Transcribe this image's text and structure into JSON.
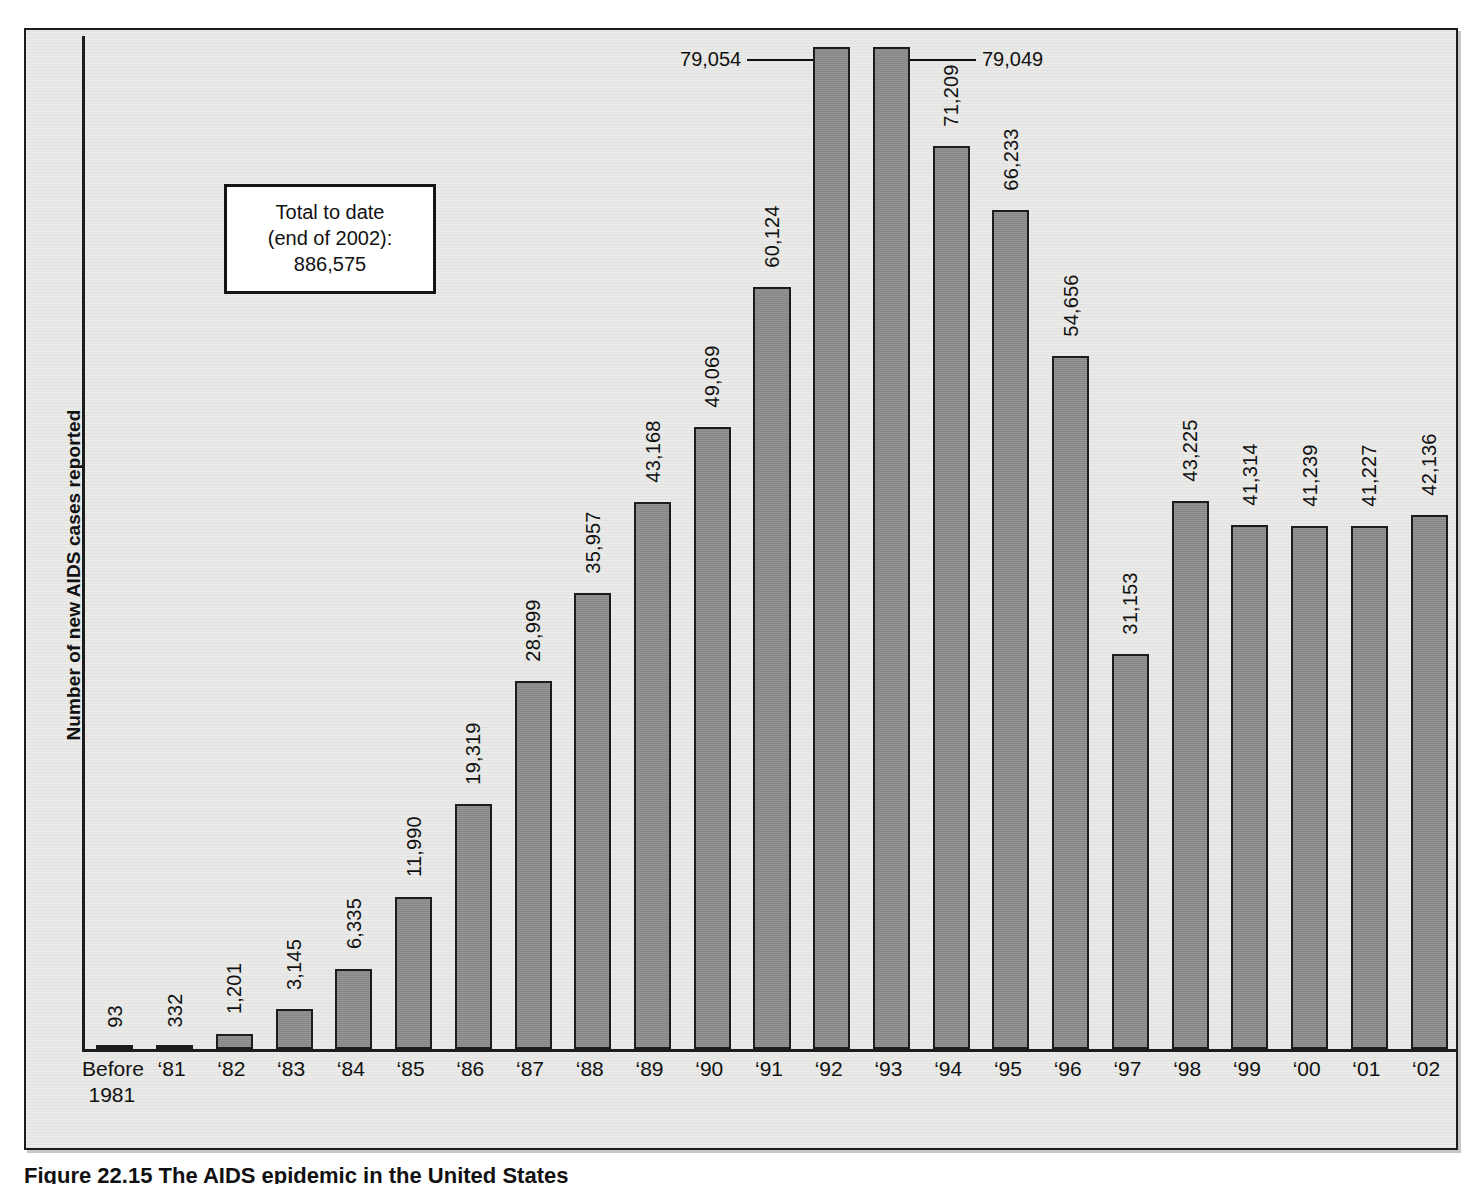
{
  "figure": {
    "y_axis_title": "Number of new AIDS cases reported",
    "caption": "Figure 22.15  The AIDS epidemic in the United States",
    "annotation": {
      "line1": "Total to date",
      "line2": "(end of 2002):",
      "line3": "886,575"
    },
    "colors": {
      "bar_fill": "#8d8d8d",
      "bar_stroke": "#1d1d1d",
      "plot_background": "#e9e9e7",
      "frame": "#1d1d1d",
      "text": "#111111",
      "annotation_background": "#ffffff"
    }
  },
  "chart_data": {
    "type": "bar",
    "title": "",
    "xlabel": "",
    "ylabel": "Number of new AIDS cases reported",
    "ylim": [
      0,
      79054
    ],
    "grid": false,
    "legend": "none",
    "categories": [
      "Before\n1981",
      "'81",
      "'82",
      "'83",
      "'84",
      "'85",
      "'86",
      "'87",
      "'88",
      "'89",
      "'90",
      "'91",
      "'92",
      "'93",
      "'94",
      "'95",
      "'96",
      "'97",
      "'98",
      "'99",
      "'00",
      "'01",
      "'02"
    ],
    "category_labels": [
      {
        "line1": "Before",
        "line2": "1981"
      },
      {
        "line1": "‘81",
        "line2": ""
      },
      {
        "line1": "‘82",
        "line2": ""
      },
      {
        "line1": "‘83",
        "line2": ""
      },
      {
        "line1": "‘84",
        "line2": ""
      },
      {
        "line1": "‘85",
        "line2": ""
      },
      {
        "line1": "‘86",
        "line2": ""
      },
      {
        "line1": "‘87",
        "line2": ""
      },
      {
        "line1": "‘88",
        "line2": ""
      },
      {
        "line1": "‘89",
        "line2": ""
      },
      {
        "line1": "‘90",
        "line2": ""
      },
      {
        "line1": "‘91",
        "line2": ""
      },
      {
        "line1": "‘92",
        "line2": ""
      },
      {
        "line1": "‘93",
        "line2": ""
      },
      {
        "line1": "‘94",
        "line2": ""
      },
      {
        "line1": "‘95",
        "line2": ""
      },
      {
        "line1": "‘96",
        "line2": ""
      },
      {
        "line1": "‘97",
        "line2": ""
      },
      {
        "line1": "‘98",
        "line2": ""
      },
      {
        "line1": "‘99",
        "line2": ""
      },
      {
        "line1": "‘00",
        "line2": ""
      },
      {
        "line1": "‘01",
        "line2": ""
      },
      {
        "line1": "‘02",
        "line2": ""
      }
    ],
    "values": [
      93,
      332,
      1201,
      3145,
      6335,
      11990,
      19319,
      28999,
      35957,
      43168,
      49069,
      60124,
      79054,
      79049,
      71209,
      66233,
      54656,
      31153,
      43225,
      41314,
      41239,
      41227,
      42136
    ],
    "value_labels": [
      "93",
      "332",
      "1,201",
      "3,145",
      "6,335",
      "11,990",
      "19,319",
      "28,999",
      "35,957",
      "43,168",
      "49,069",
      "60,124",
      "79,054",
      "79,049",
      "71,209",
      "66,233",
      "54,656",
      "31,153",
      "43,225",
      "41,314",
      "41,239",
      "41,227",
      "42,136"
    ],
    "label_styles": [
      "rot",
      "rot",
      "rot",
      "rot",
      "rot",
      "rot",
      "rot",
      "rot",
      "rot",
      "rot",
      "rot",
      "rot",
      "callout-left",
      "callout-right",
      "rot",
      "rot",
      "rot",
      "rot",
      "rot",
      "rot",
      "rot",
      "rot",
      "rot"
    ],
    "total_to_date": 886575,
    "total_to_date_label": "886,575"
  }
}
